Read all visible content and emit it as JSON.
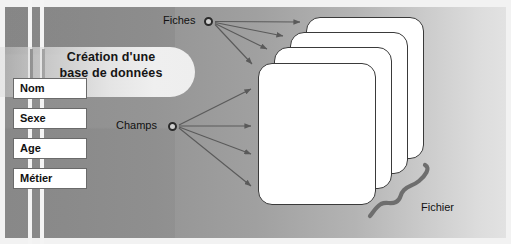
{
  "diagram": {
    "title_line1": "Création d'une",
    "title_line2": "base de données",
    "nodes": {
      "fiches_label": "Fiches",
      "champs_label": "Champs"
    },
    "fields": [
      {
        "label": "Nom"
      },
      {
        "label": "Sexe"
      },
      {
        "label": "Age"
      },
      {
        "label": "Métier"
      }
    ],
    "brace_label": "Fichier",
    "card_count": 4,
    "colors": {
      "panel_dark": "#8e8e8e",
      "panel_light": "#e2e2e2",
      "card_fill": "#ffffff",
      "card_border": "#3a3a3a",
      "arrow": "#5a5a5a",
      "brace": "#6e6e6e",
      "text": "#111111",
      "stripe": "#f4f4f4",
      "stripe_dark": "#1d1d1d"
    }
  }
}
